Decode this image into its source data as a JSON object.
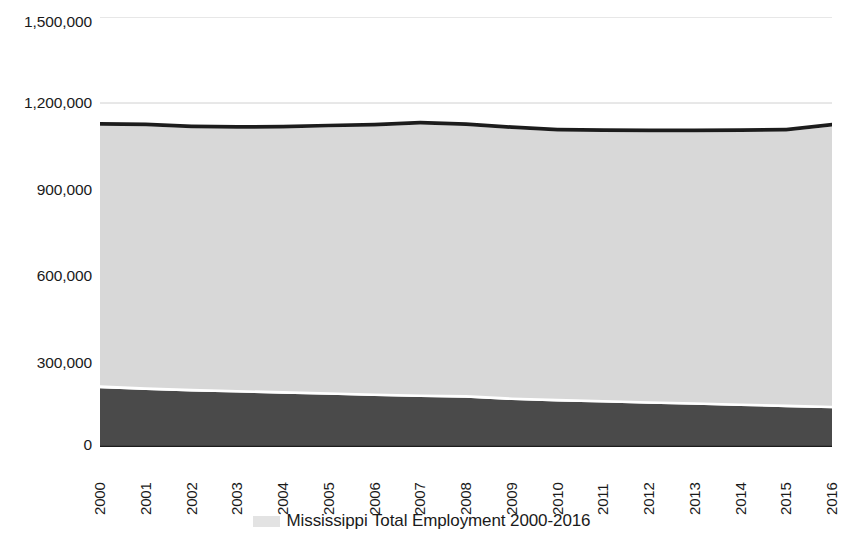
{
  "chart_data": {
    "type": "area",
    "title": "",
    "subtitle": "",
    "xlabel": "",
    "ylabel": "",
    "stacked": true,
    "grid": true,
    "grid_axis": "y",
    "legend_position": "bottom",
    "legend_entries": [
      "Mississippi Total Employment 2000-2016"
    ],
    "x": [
      2000,
      2001,
      2002,
      2003,
      2004,
      2005,
      2006,
      2007,
      2008,
      2009,
      2010,
      2011,
      2012,
      2013,
      2014,
      2015,
      2016
    ],
    "xtick_labels": [
      "2000",
      "2001",
      "2002",
      "2003",
      "2004",
      "2005",
      "2006",
      "2007",
      "2008",
      "2009",
      "2010",
      "2011",
      "2012",
      "2013",
      "2014",
      "2015",
      "2016"
    ],
    "ylim": [
      0,
      1500000
    ],
    "ytick_labels": [
      "0",
      "300,000",
      "600,000",
      "900,000",
      "1,200,000",
      "1,500,000"
    ],
    "ytick_values": [
      0,
      300000,
      600000,
      900000,
      1200000,
      1500000
    ],
    "series": [
      {
        "name": "Mississippi Total Employment 2000-2016",
        "color": "#4a4a4a",
        "values": [
          205000,
          199000,
          194000,
          190000,
          186000,
          182000,
          178000,
          174000,
          172000,
          164000,
          159000,
          155000,
          151000,
          147000,
          143000,
          139000,
          135000
        ]
      },
      {
        "name": "Series 2",
        "color": "#ffffff",
        "values": [
          10000,
          9000,
          9000,
          9000,
          9000,
          9000,
          9000,
          9000,
          9000,
          9000,
          9000,
          9000,
          9000,
          9000,
          9000,
          9000,
          9000
        ]
      },
      {
        "name": "Series 3",
        "color": "#d8d8d8",
        "values": [
          906000,
          911000,
          909000,
          911000,
          916000,
          924000,
          931000,
          942000,
          939000,
          936000,
          933000,
          935000,
          938000,
          942000,
          947000,
          953000,
          974000
        ]
      },
      {
        "name": "Series 4",
        "color": "#1c1c1c",
        "values": [
          13000,
          13000,
          13000,
          13000,
          13000,
          13000,
          13000,
          13000,
          13000,
          13000,
          13000,
          13000,
          13000,
          13000,
          13000,
          13000,
          13000
        ]
      }
    ],
    "totals": [
      1134000,
      1132000,
      1125000,
      1123000,
      1124000,
      1128000,
      1131000,
      1138000,
      1133000,
      1122000,
      1114000,
      1112000,
      1111000,
      1111000,
      1112000,
      1114000,
      1131000
    ],
    "colors": {
      "band_top_dark": "#1c1c1c",
      "band_main_light": "#d8d8d8",
      "band_bottom_dark": "#4a4a4a",
      "separator": "#ffffff",
      "gridline": "#d0d0d0",
      "text": "#1a1a1a",
      "background": "#ffffff"
    }
  },
  "axis": {
    "y_labels": [
      "1,500,000",
      "1,200,000",
      "900,000",
      "600,000",
      "300,000",
      "0"
    ],
    "x_labels": [
      "2000",
      "2001",
      "2002",
      "2003",
      "2004",
      "2005",
      "2006",
      "2007",
      "2008",
      "2009",
      "2010",
      "2011",
      "2012",
      "2013",
      "2014",
      "2015",
      "2016"
    ]
  },
  "legend": {
    "swatch_name": "legend-color-swatch",
    "label": "Mississippi Total Employment 2000-2016"
  }
}
